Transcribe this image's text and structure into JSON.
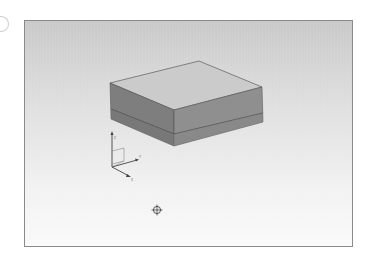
{
  "viewport": {
    "background_top": "#c9c9c9",
    "background_bottom": "#fafafa",
    "border_color": "#8a8a8a"
  },
  "model": {
    "name": "box-solid",
    "top_face_color": "#cbcbcb",
    "left_face_color": "#7e7e7e",
    "right_face_color": "#8f8f8f",
    "edge_color": "#4a4a4a",
    "seam_color": "#4d4d4d"
  },
  "triad": {
    "axis_z_label": "Z",
    "axis_y_label": "Y",
    "axis_x_label": "X",
    "labels_legible": false
  },
  "crosshair": {
    "icon": "crosshair-icon"
  }
}
